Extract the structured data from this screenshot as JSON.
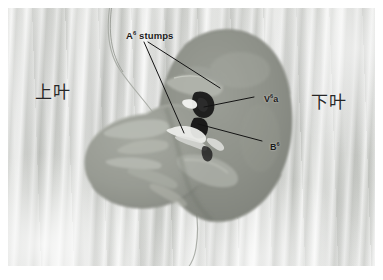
{
  "figure": {
    "kind": "surgical-anatomy-photograph",
    "modality": "grayscale intraoperative photo",
    "plate_background_color": "#dcdddb",
    "tissue_color": "#8e9189",
    "tissue_color_light": "#a9aca4",
    "leader_line_color": "#141414",
    "label_text_color": "#1b1b1b"
  },
  "annotations": {
    "a6_stumps": {
      "label_prefix": "A",
      "label_superscript": "6",
      "label_suffix": " stumps",
      "full_text": "A6 stumps",
      "leader_count": 2
    },
    "v6a": {
      "label_prefix": "V",
      "label_superscript": "6",
      "label_suffix": "a",
      "full_text": "V6a",
      "leader_count": 1
    },
    "b6": {
      "label_prefix": "B",
      "label_superscript": "6",
      "label_suffix": "",
      "full_text": "B6",
      "leader_count": 1
    }
  },
  "lobe_labels": {
    "upper": "上叶",
    "lower": "下叶"
  }
}
